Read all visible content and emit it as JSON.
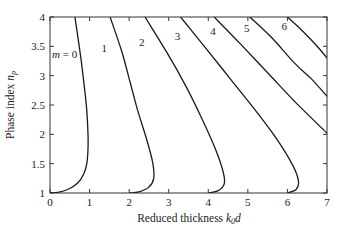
{
  "chart_data": {
    "type": "line",
    "title": "",
    "xlabel": "Reduced thickness k0d",
    "xlabel_main": "Reduced thickness ",
    "xlabel_var": "k",
    "xlabel_sub": "0",
    "xlabel_tail": "d",
    "ylabel": "Phase index n_p",
    "ylabel_main": "Phase index ",
    "ylabel_var": "n",
    "ylabel_sub": "p",
    "xlim": [
      0,
      7
    ],
    "ylim": [
      1,
      4
    ],
    "xticks": [
      0,
      1,
      2,
      3,
      4,
      5,
      6,
      7
    ],
    "yticks": [
      1,
      1.5,
      2,
      2.5,
      3,
      3.5,
      4
    ],
    "ytick_labels": [
      "1",
      "1.5",
      "2",
      "2.5",
      "3",
      "3.5",
      "4"
    ],
    "grid": false,
    "legend": "none (inline curve labels)",
    "series": [
      {
        "name": "m = 0",
        "label": "m = 0",
        "label_pos": [
          0.05,
          3.3
        ],
        "points": [
          [
            0.0,
            1.0
          ],
          [
            0.2,
            1.01
          ],
          [
            0.45,
            1.06
          ],
          [
            0.7,
            1.17
          ],
          [
            0.85,
            1.32
          ],
          [
            0.93,
            1.5
          ],
          [
            0.96,
            1.75
          ],
          [
            0.96,
            2.0
          ],
          [
            0.93,
            2.4
          ],
          [
            0.87,
            2.8
          ],
          [
            0.78,
            3.3
          ],
          [
            0.63,
            4.0
          ]
        ]
      },
      {
        "name": "m = 1",
        "label": "1",
        "label_pos": [
          1.3,
          3.4
        ],
        "points": [
          [
            2.0,
            1.0
          ],
          [
            2.25,
            1.02
          ],
          [
            2.5,
            1.1
          ],
          [
            2.62,
            1.25
          ],
          [
            2.6,
            1.5
          ],
          [
            2.45,
            1.9
          ],
          [
            2.22,
            2.4
          ],
          [
            2.02,
            2.9
          ],
          [
            1.82,
            3.4
          ],
          [
            1.52,
            4.0
          ]
        ]
      },
      {
        "name": "m = 2",
        "label": "2",
        "label_pos": [
          2.25,
          3.5
        ],
        "points": [
          [
            4.0,
            1.0
          ],
          [
            4.25,
            1.04
          ],
          [
            4.4,
            1.15
          ],
          [
            4.38,
            1.35
          ],
          [
            4.18,
            1.75
          ],
          [
            3.85,
            2.25
          ],
          [
            3.45,
            2.8
          ],
          [
            2.95,
            3.4
          ],
          [
            2.4,
            4.0
          ]
        ]
      },
      {
        "name": "m = 3",
        "label": "3",
        "label_pos": [
          3.15,
          3.6
        ],
        "points": [
          [
            6.0,
            1.0
          ],
          [
            6.22,
            1.06
          ],
          [
            6.28,
            1.2
          ],
          [
            6.15,
            1.45
          ],
          [
            5.75,
            1.9
          ],
          [
            5.2,
            2.4
          ],
          [
            4.55,
            2.95
          ],
          [
            3.9,
            3.5
          ],
          [
            3.3,
            4.0
          ]
        ]
      },
      {
        "name": "m = 4",
        "label": "4",
        "label_pos": [
          4.05,
          3.7
        ],
        "points": [
          [
            4.15,
            4.0
          ],
          [
            4.8,
            3.55
          ],
          [
            5.5,
            3.05
          ],
          [
            6.2,
            2.55
          ],
          [
            7.0,
            2.02
          ]
        ]
      },
      {
        "name": "m = 5",
        "label": "5",
        "label_pos": [
          4.9,
          3.75
        ],
        "points": [
          [
            5.05,
            4.0
          ],
          [
            5.6,
            3.65
          ],
          [
            6.2,
            3.2
          ],
          [
            6.6,
            2.95
          ],
          [
            7.0,
            2.65
          ]
        ]
      },
      {
        "name": "m = 6",
        "label": "6",
        "label_pos": [
          5.85,
          3.78
        ],
        "points": [
          [
            6.0,
            4.0
          ],
          [
            6.4,
            3.75
          ],
          [
            6.75,
            3.5
          ],
          [
            7.0,
            3.3
          ]
        ]
      }
    ]
  },
  "plot": {
    "left": 50,
    "right": 327,
    "top": 17,
    "bottom": 193,
    "line_color": "#1a1a1a"
  }
}
